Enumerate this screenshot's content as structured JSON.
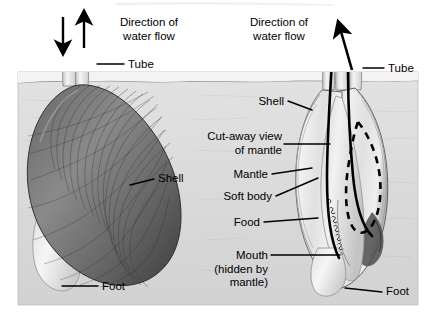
{
  "figure": {
    "panel": {
      "bg_color": "#dcdcdc",
      "border_color": "#b4b4b4",
      "water_color": "#e8e8e8",
      "shell_dark": "#5a5a5a",
      "shell_light": "#efefef",
      "line_color": "#000000"
    }
  },
  "left_view": {
    "name": "external-view",
    "labels": {
      "direction_line1": "Direction of",
      "direction_line2": "water flow",
      "tube": "Tube",
      "shell": "Shell",
      "foot": "Foot"
    },
    "arrows": [
      {
        "name": "incurrent-arrow",
        "direction": "down"
      },
      {
        "name": "excurrent-arrow",
        "direction": "up"
      }
    ]
  },
  "right_view": {
    "name": "cut-away-view",
    "labels": {
      "direction_line1": "Direction of",
      "direction_line2": "water flow",
      "tube": "Tube",
      "shell": "Shell",
      "cutaway_line1": "Cut-away view",
      "cutaway_line2": "of mantle",
      "mantle": "Mantle",
      "soft_body": "Soft body",
      "food": "Food",
      "mouth_line1": "Mouth",
      "mouth_line2": "(hidden by mantle)",
      "foot": "Foot"
    },
    "arrows": [
      {
        "name": "excurrent-arrow",
        "direction": "up"
      }
    ]
  }
}
